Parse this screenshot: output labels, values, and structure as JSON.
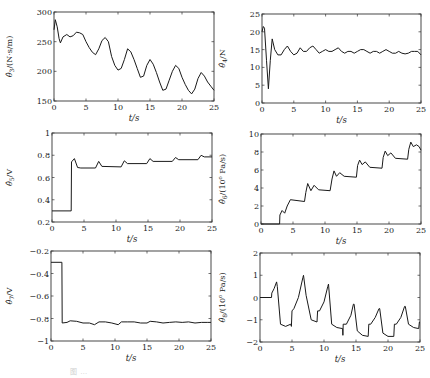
{
  "figure": {
    "caption": "图 …"
  },
  "chart_data": [
    {
      "id": "theta3",
      "type": "line",
      "title": "",
      "xlabel": "t/s",
      "ylabel": "θ̂3/(N·s/m)",
      "xlim": [
        0,
        25
      ],
      "ylim": [
        150,
        300
      ],
      "xticks": [
        0,
        5,
        10,
        15,
        20,
        25
      ],
      "yticks": [
        150,
        200,
        250,
        300
      ],
      "grid": false,
      "x": [
        0,
        0.2,
        0.5,
        0.8,
        1.0,
        1.4,
        2.0,
        2.5,
        3.0,
        3.5,
        4.0,
        4.5,
        5.0,
        5.5,
        6.0,
        6.5,
        7.0,
        7.5,
        8.0,
        8.5,
        9.0,
        9.5,
        10.0,
        10.5,
        11.0,
        11.5,
        12.0,
        12.5,
        13.0,
        13.5,
        14.0,
        14.5,
        15.0,
        15.5,
        16.0,
        16.5,
        17.0,
        17.5,
        18.0,
        18.5,
        19.0,
        19.5,
        20.0,
        20.5,
        21.0,
        21.5,
        22.0,
        22.5,
        23.0,
        23.5,
        24.0,
        24.5,
        25.0
      ],
      "values": [
        270,
        287,
        275,
        255,
        248,
        258,
        262,
        258,
        260,
        266,
        265,
        262,
        250,
        240,
        232,
        228,
        238,
        252,
        257,
        250,
        225,
        210,
        202,
        205,
        220,
        238,
        233,
        220,
        205,
        190,
        192,
        210,
        220,
        212,
        198,
        182,
        168,
        170,
        185,
        200,
        210,
        205,
        190,
        178,
        168,
        162,
        170,
        188,
        198,
        192,
        182,
        175,
        168
      ]
    },
    {
      "id": "theta4",
      "type": "line",
      "title": "",
      "xlabel": "t/s",
      "ylabel": "θ̂4/N",
      "xlim": [
        0,
        25
      ],
      "ylim": [
        0,
        25
      ],
      "xticks": [
        0,
        5,
        10,
        15,
        20,
        25
      ],
      "yticks": [
        0,
        5,
        10,
        15,
        20,
        25
      ],
      "grid": false,
      "x": [
        0,
        0.2,
        0.4,
        0.7,
        1.0,
        1.3,
        1.6,
        2.0,
        2.5,
        3.0,
        3.5,
        4.0,
        4.5,
        5.0,
        5.5,
        6.0,
        6.5,
        7.0,
        7.5,
        8.0,
        8.5,
        9.0,
        9.5,
        10.0,
        10.5,
        11.0,
        11.5,
        12.0,
        12.5,
        13.0,
        13.5,
        14.0,
        14.5,
        15.0,
        15.5,
        16.0,
        16.5,
        17.0,
        17.5,
        18.0,
        18.5,
        19.0,
        19.5,
        20.0,
        20.5,
        21.0,
        21.5,
        22.0,
        22.5,
        23.0,
        23.5,
        24.0,
        24.5,
        25.0
      ],
      "values": [
        20,
        21.5,
        21,
        12,
        4,
        12,
        18,
        15,
        13.5,
        13.5,
        15,
        16,
        14.5,
        13.5,
        14,
        15.5,
        14.5,
        14.5,
        15.5,
        16,
        15,
        14,
        14.5,
        15,
        14.5,
        14.5,
        15,
        15.5,
        14.5,
        14,
        14.5,
        14.5,
        14,
        14.5,
        15,
        15,
        14.5,
        14,
        14.5,
        14.5,
        14,
        14.5,
        15,
        14.5,
        14,
        14,
        14.5,
        14,
        13.8,
        14,
        14.5,
        14.5,
        14.5,
        13.5
      ]
    },
    {
      "id": "theta5",
      "type": "line",
      "title": "",
      "xlabel": "t/s",
      "ylabel": "θ̂5/V",
      "xlim": [
        0,
        25
      ],
      "ylim": [
        0.2,
        1
      ],
      "xticks": [
        0,
        5,
        10,
        15,
        20,
        25
      ],
      "yticks": [
        0.2,
        0.4,
        0.6,
        0.8,
        1
      ],
      "grid": false,
      "x": [
        0,
        3.0,
        3.05,
        3.5,
        4.0,
        4.5,
        6.8,
        7.3,
        7.8,
        10.8,
        11.3,
        11.8,
        14.8,
        15.3,
        15.8,
        18.8,
        19.3,
        19.8,
        22.8,
        23.3,
        23.8,
        25.0
      ],
      "values": [
        0.3,
        0.3,
        0.74,
        0.77,
        0.69,
        0.685,
        0.685,
        0.745,
        0.7,
        0.695,
        0.75,
        0.725,
        0.725,
        0.77,
        0.745,
        0.745,
        0.78,
        0.76,
        0.76,
        0.8,
        0.785,
        0.785
      ]
    },
    {
      "id": "theta6",
      "type": "line",
      "title": "",
      "xlabel": "t/s",
      "ylabel": "θ̂6/(10^6 Pa/s)",
      "xlim": [
        0,
        25
      ],
      "ylim": [
        0,
        10
      ],
      "xticks": [
        0,
        5,
        10,
        15,
        20,
        25
      ],
      "yticks": [
        0,
        2,
        4,
        6,
        8,
        10
      ],
      "grid": false,
      "x": [
        0,
        2.9,
        2.95,
        3.3,
        3.7,
        4.1,
        4.6,
        6.8,
        7.0,
        7.3,
        7.8,
        8.3,
        9.0,
        10.8,
        11.1,
        11.4,
        11.8,
        12.3,
        13.0,
        14.9,
        15.1,
        15.4,
        15.8,
        16.3,
        17.0,
        18.9,
        19.1,
        19.4,
        19.8,
        20.3,
        21.0,
        22.9,
        23.1,
        23.4,
        23.8,
        24.3,
        24.7,
        25.0
      ],
      "values": [
        0,
        0,
        1.0,
        1.5,
        1.2,
        2.0,
        2.7,
        2.5,
        3.5,
        4.5,
        3.7,
        4.3,
        3.8,
        3.7,
        5.0,
        5.9,
        5.3,
        5.7,
        5.3,
        5.2,
        6.5,
        7.1,
        6.6,
        6.9,
        6.3,
        6.2,
        7.4,
        8.1,
        7.6,
        7.9,
        7.3,
        7.2,
        8.3,
        9.1,
        8.6,
        8.8,
        8.6,
        8.2
      ]
    },
    {
      "id": "theta7",
      "type": "line",
      "title": "",
      "xlabel": "t/s",
      "ylabel": "θ̂7/V",
      "xlim": [
        0,
        25
      ],
      "ylim": [
        -1,
        -0.2
      ],
      "xticks": [
        0,
        5,
        10,
        15,
        20,
        25
      ],
      "yticks": [
        -1,
        -0.8,
        -0.6,
        -0.4,
        -0.2
      ],
      "grid": false,
      "x": [
        0,
        1.7,
        1.75,
        2.5,
        3.0,
        4.0,
        5.0,
        6.0,
        6.8,
        7.5,
        8.5,
        9.5,
        10.5,
        11.0,
        12.0,
        13.0,
        14.0,
        15.0,
        15.5,
        16.5,
        17.5,
        18.5,
        19.5,
        20.5,
        21.5,
        22.5,
        23.5,
        24.5,
        25.0
      ],
      "values": [
        -0.3,
        -0.3,
        -0.84,
        -0.835,
        -0.82,
        -0.825,
        -0.84,
        -0.84,
        -0.855,
        -0.83,
        -0.83,
        -0.84,
        -0.855,
        -0.83,
        -0.83,
        -0.83,
        -0.84,
        -0.84,
        -0.825,
        -0.83,
        -0.84,
        -0.835,
        -0.83,
        -0.835,
        -0.83,
        -0.84,
        -0.835,
        -0.835,
        -0.835
      ]
    },
    {
      "id": "theta8",
      "type": "line",
      "title": "",
      "xlabel": "t/s",
      "ylabel": "θ̂8/(10^6 Pa/s)",
      "xlim": [
        0,
        25
      ],
      "ylim": [
        -2,
        2
      ],
      "xticks": [
        0,
        5,
        10,
        15,
        20,
        25
      ],
      "yticks": [
        -2,
        -1,
        0,
        1,
        2
      ],
      "grid": false,
      "x": [
        0,
        1.8,
        1.85,
        2.2,
        2.6,
        2.7,
        3.2,
        4.0,
        4.8,
        4.9,
        5.0,
        5.3,
        6.0,
        6.7,
        6.8,
        7.2,
        8.0,
        8.9,
        9.0,
        9.3,
        10.0,
        10.6,
        10.7,
        11.2,
        12.0,
        12.9,
        12.95,
        13.0,
        13.5,
        14.2,
        14.6,
        14.7,
        15.2,
        16.0,
        16.9,
        17.0,
        17.3,
        18.0,
        18.6,
        18.7,
        19.2,
        20.0,
        20.9,
        21.0,
        21.3,
        22.0,
        22.6,
        22.7,
        23.2,
        24.0,
        24.8,
        24.9,
        25.0
      ],
      "values": [
        0,
        0,
        0.2,
        0.4,
        0.7,
        0.5,
        -1.2,
        -1.3,
        -1.2,
        -1.3,
        -0.6,
        -0.5,
        0,
        0.9,
        1.0,
        0.1,
        -1.0,
        -1.1,
        -0.6,
        -0.6,
        -0.2,
        0.5,
        0.6,
        -1.2,
        -1.35,
        -1.4,
        -1.7,
        -1.2,
        -1.2,
        -0.8,
        -0.3,
        -0.3,
        -1.5,
        -1.7,
        -1.75,
        -1.2,
        -1.2,
        -0.9,
        -0.5,
        -0.5,
        -1.6,
        -1.75,
        -1.75,
        -1.2,
        -1.2,
        -0.9,
        -0.4,
        -0.4,
        -1.2,
        -1.35,
        -1.4,
        -1.1,
        -1.1
      ]
    }
  ]
}
